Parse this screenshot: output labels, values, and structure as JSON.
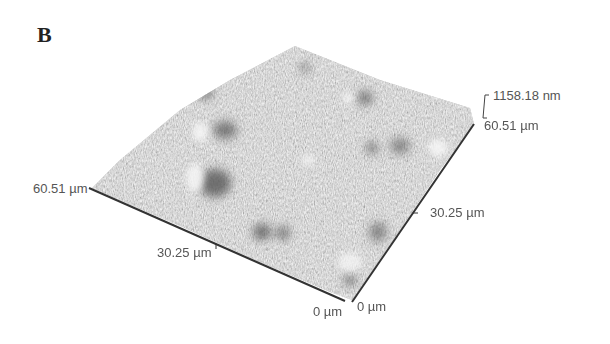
{
  "figure": {
    "panel_label": "B",
    "type": "3D AFM surface topography",
    "z_range_label": "1158.18 nm",
    "x_axis": {
      "max_label": "60.51 µm",
      "mid_label": "30.25 µm",
      "min_label": "0 µm"
    },
    "y_axis": {
      "max_label": "60.51 µm",
      "mid_label": "30.25 µm",
      "min_label": "0 µm"
    },
    "colors": {
      "surface_base": "#b8b8b8",
      "surface_dark": "#6a6a6a",
      "surface_light": "#eeeeee",
      "axis_line": "#333333",
      "label_text": "#555555"
    }
  }
}
